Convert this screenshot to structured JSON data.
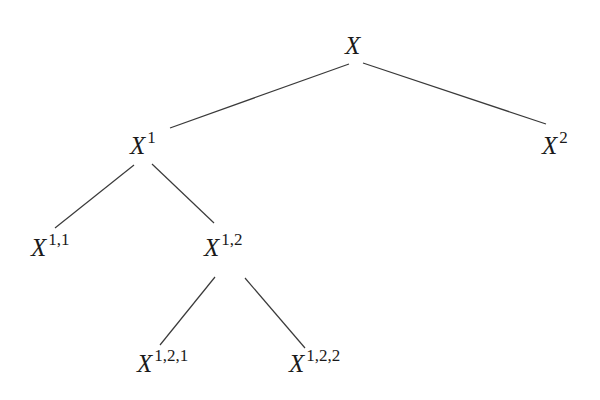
{
  "diagram": {
    "type": "tree",
    "nodes": [
      {
        "id": "root",
        "base": "X",
        "sup": "",
        "x": 345,
        "y": 33
      },
      {
        "id": "n1",
        "base": "X",
        "sup": "1",
        "x": 130,
        "y": 133
      },
      {
        "id": "n2",
        "base": "X",
        "sup": "2",
        "x": 542,
        "y": 133
      },
      {
        "id": "n11",
        "base": "X",
        "sup": "1,1",
        "x": 31,
        "y": 235
      },
      {
        "id": "n12",
        "base": "X",
        "sup": "1,2",
        "x": 204,
        "y": 235
      },
      {
        "id": "n121",
        "base": "X",
        "sup": "1,2,1",
        "x": 137,
        "y": 351
      },
      {
        "id": "n122",
        "base": "X",
        "sup": "1,2,2",
        "x": 289,
        "y": 351
      }
    ],
    "edges": [
      {
        "from": "root",
        "to": "n1",
        "x1": 349,
        "y1": 64,
        "x2": 170,
        "y2": 128
      },
      {
        "from": "root",
        "to": "n2",
        "x1": 363,
        "y1": 63,
        "x2": 546,
        "y2": 124
      },
      {
        "from": "n1",
        "to": "n11",
        "x1": 134,
        "y1": 165,
        "x2": 55,
        "y2": 228
      },
      {
        "from": "n1",
        "to": "n12",
        "x1": 152,
        "y1": 164,
        "x2": 214,
        "y2": 223
      },
      {
        "from": "n12",
        "to": "n121",
        "x1": 215,
        "y1": 277,
        "x2": 160,
        "y2": 345
      },
      {
        "from": "n12",
        "to": "n122",
        "x1": 245,
        "y1": 278,
        "x2": 305,
        "y2": 348
      }
    ]
  },
  "labels": {
    "root": {
      "base": "X",
      "sup": ""
    },
    "n1": {
      "base": "X",
      "sup": "1"
    },
    "n2": {
      "base": "X",
      "sup": "2"
    },
    "n11": {
      "base": "X",
      "sup": "1,1"
    },
    "n12": {
      "base": "X",
      "sup": "1,2"
    },
    "n121": {
      "base": "X",
      "sup": "1,2,1"
    },
    "n122": {
      "base": "X",
      "sup": "1,2,2"
    }
  }
}
